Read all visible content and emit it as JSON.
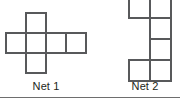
{
  "figure": {
    "kind": "geometry-diagram",
    "background_color": "#ffffff",
    "stroke_color": "#58595b",
    "label_color": "#231f20",
    "stroke_width": 2,
    "canvas": {
      "width": 180,
      "height": 99
    }
  },
  "nets": [
    {
      "id": "net1",
      "label": "Net 1",
      "shape": "cross",
      "cell_size": 20,
      "origin": {
        "x": 6,
        "y": 13
      },
      "columns": 4,
      "rows": 3,
      "cells": [
        {
          "col": 1,
          "row": 0
        },
        {
          "col": 0,
          "row": 1
        },
        {
          "col": 1,
          "row": 1
        },
        {
          "col": 2,
          "row": 1
        },
        {
          "col": 3,
          "row": 1
        },
        {
          "col": 1,
          "row": 2
        }
      ],
      "cell_count": 6
    },
    {
      "id": "net2",
      "label": "Net 2",
      "shape": "zigzag",
      "cell_size": 21,
      "origin": {
        "x": 129,
        "y": -3
      },
      "columns": 2,
      "rows": 4,
      "cells": [
        {
          "col": 0,
          "row": 0
        },
        {
          "col": 1,
          "row": 0
        },
        {
          "col": 1,
          "row": 1
        },
        {
          "col": 1,
          "row": 2
        },
        {
          "col": 0,
          "row": 3
        },
        {
          "col": 1,
          "row": 3
        }
      ],
      "cell_count": 6
    }
  ],
  "rule": {
    "present": true,
    "color": "#6e6e6e",
    "y": 97
  }
}
